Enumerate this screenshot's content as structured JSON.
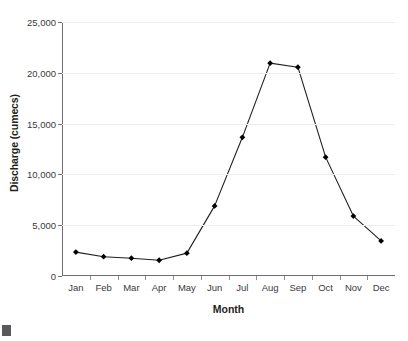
{
  "chart_data": {
    "type": "line",
    "title": "",
    "xlabel": "Month",
    "ylabel": "Discharge (cumecs)",
    "categories": [
      "Jan",
      "Feb",
      "Mar",
      "Apr",
      "May",
      "Jun",
      "Jul",
      "Aug",
      "Sep",
      "Oct",
      "Nov",
      "Dec"
    ],
    "values": [
      2350,
      1900,
      1750,
      1550,
      2250,
      6900,
      13650,
      20950,
      20550,
      11700,
      5900,
      3450
    ],
    "series": [
      {
        "name": "Discharge",
        "values": [
          2350,
          1900,
          1750,
          1550,
          2250,
          6900,
          13650,
          20950,
          20550,
          11700,
          5900,
          3450
        ]
      }
    ],
    "ylim": [
      0,
      25000
    ],
    "ytick_values": [
      0,
      5000,
      10000,
      15000,
      20000,
      25000
    ],
    "ytick_labels": [
      "0",
      "5,000",
      "10,000",
      "15,000",
      "20,000",
      "25,000"
    ],
    "grid": "horizontal",
    "legend": "none",
    "marker": "diamond",
    "line_color": "#231f20",
    "marker_color": "#000000",
    "gridline_color": "#eceded",
    "axis_color": "#6d6e71"
  }
}
